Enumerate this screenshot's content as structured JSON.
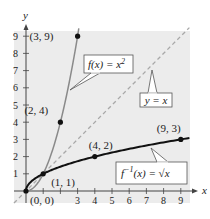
{
  "chart_data": {
    "type": "line",
    "title": "",
    "xlabel": "x",
    "ylabel": "y",
    "xlim": [
      0,
      9
    ],
    "ylim": [
      0,
      9
    ],
    "x_ticks": [
      1,
      2,
      3,
      4,
      5,
      6,
      7,
      8,
      9
    ],
    "x_tick_labels": [
      "",
      "",
      "3",
      "4",
      "5",
      "6",
      "7",
      "8",
      "9"
    ],
    "y_ticks": [
      1,
      2,
      3,
      4,
      5,
      6,
      7,
      8,
      9
    ],
    "y_tick_labels": [
      "1",
      "2",
      "3",
      "4",
      "5",
      "6",
      "7",
      "8",
      "9"
    ],
    "grid": false,
    "background": "#ececec",
    "series": [
      {
        "name": "f(x) = x²",
        "label_text": "f(x) = x",
        "label_sup": "2",
        "function": "x^2",
        "domain": [
          0,
          3
        ],
        "color": "#8a8a8a",
        "style": "solid",
        "points": [
          [
            0,
            0
          ],
          [
            1,
            1
          ],
          [
            2,
            4
          ],
          [
            3,
            9
          ]
        ]
      },
      {
        "name": "f⁻¹(x) = √x",
        "label_text": "f",
        "label_sup": "−1",
        "label_rest": "(x) = √x",
        "function": "sqrt(x)",
        "domain": [
          0,
          9
        ],
        "color": "#111111",
        "style": "solid",
        "points": [
          [
            0,
            0
          ],
          [
            1,
            1
          ],
          [
            4,
            2
          ],
          [
            9,
            3
          ]
        ]
      },
      {
        "name": "y = x",
        "label_text": "y = x",
        "function": "x",
        "domain": [
          -0.7,
          9.5
        ],
        "color": "#a8a8a8",
        "style": "dashed",
        "points": []
      }
    ],
    "annotations": [
      {
        "text": "(3, 9)",
        "x": 3,
        "y": 9
      },
      {
        "text": "(2, 4)",
        "x": 2,
        "y": 4
      },
      {
        "text": "(1, 1)",
        "x": 1,
        "y": 1
      },
      {
        "text": "(0, 0)",
        "x": 0,
        "y": 0
      },
      {
        "text": "(4, 2)",
        "x": 4,
        "y": 2
      },
      {
        "text": "(9, 3)",
        "x": 9,
        "y": 3
      }
    ]
  }
}
